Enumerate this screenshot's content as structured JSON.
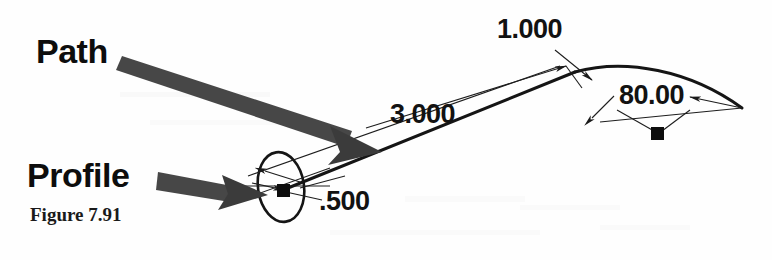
{
  "figure": {
    "caption": "Figure 7.91",
    "background_color": "#fefefe",
    "ink_color": "#101010",
    "arrow_color": "#3f3f3f",
    "width": 772,
    "height": 260
  },
  "callouts": [
    {
      "name": "path",
      "label": "Path"
    },
    {
      "name": "profile",
      "label": "Profile"
    }
  ],
  "dimensions": [
    {
      "name": "sweep-length",
      "label": "3.000"
    },
    {
      "name": "profile-size",
      "label": ".500"
    },
    {
      "name": "arc-height",
      "label": "1.000"
    },
    {
      "name": "arc-angle",
      "label": "80.00"
    }
  ],
  "geometry": {
    "profile_ellipse": {
      "cx": 281,
      "cy": 187,
      "rx": 23,
      "ry": 35,
      "rotation": -8
    },
    "grip_points": [
      {
        "name": "profile-grip",
        "x": 283,
        "y": 190
      },
      {
        "name": "arc-grip",
        "x": 657,
        "y": 133
      }
    ],
    "path_start": {
      "x": 283,
      "y": 190
    },
    "path_apex": {
      "x": 575,
      "y": 72
    },
    "path_end": {
      "x": 742,
      "y": 108
    }
  }
}
